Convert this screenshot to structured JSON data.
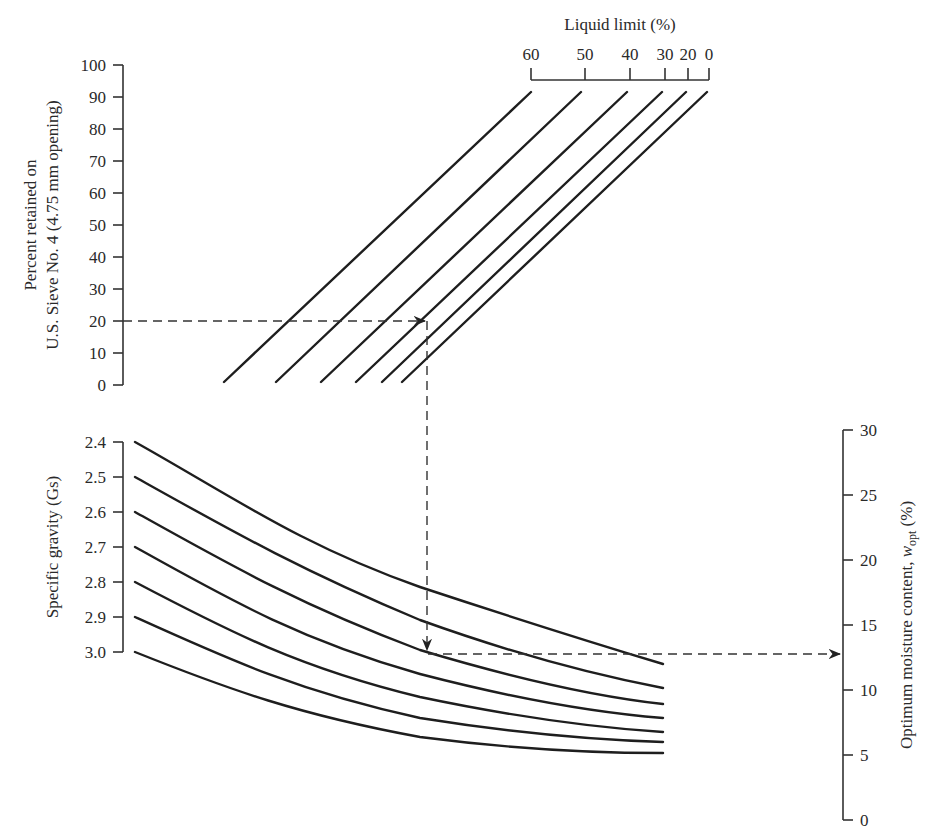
{
  "chart_data": {
    "type": "line",
    "panels": [
      {
        "name": "upper",
        "ylabel_line1": "Percent retained on",
        "ylabel_line2": "U.S. Sieve No. 4 (4.75 mm opening)",
        "yticks": [
          "0",
          "10",
          "20",
          "30",
          "40",
          "50",
          "60",
          "70",
          "80",
          "90",
          "100"
        ],
        "ylim": [
          0,
          100
        ],
        "top_axis_label": "Liquid limit (%)",
        "top_axis_ticks": [
          "60",
          "50",
          "40",
          "30",
          "20",
          "0"
        ],
        "series": [
          {
            "name": "LL 60",
            "start": {
              "percent_retained": 0
            },
            "end": {
              "percent_retained": 92
            }
          },
          {
            "name": "LL 50",
            "start": {
              "percent_retained": 0
            },
            "end": {
              "percent_retained": 92
            }
          },
          {
            "name": "LL 40",
            "start": {
              "percent_retained": 0
            },
            "end": {
              "percent_retained": 92
            }
          },
          {
            "name": "LL 30",
            "start": {
              "percent_retained": 0
            },
            "end": {
              "percent_retained": 92
            }
          },
          {
            "name": "LL 20",
            "start": {
              "percent_retained": 0
            },
            "end": {
              "percent_retained": 92
            }
          },
          {
            "name": "LL 0",
            "start": {
              "percent_retained": 0
            },
            "end": {
              "percent_retained": 92
            }
          }
        ]
      },
      {
        "name": "lower",
        "ylabel": "Specific gravity (Gs)",
        "yticks_left": [
          "2.4",
          "2.5",
          "2.6",
          "2.7",
          "2.8",
          "2.9",
          "3.0"
        ],
        "right_axis_label": "Optimum moisture content, w_opt (%)",
        "right_axis_label_main": "Optimum moisture content, ",
        "right_axis_label_sym": "w",
        "right_axis_label_sub": "opt",
        "right_axis_label_end": " (%)",
        "yticks_right": [
          "0",
          "5",
          "10",
          "15",
          "20",
          "25",
          "30"
        ],
        "ylim_right": [
          0,
          30
        ],
        "series": [
          {
            "name": "Gs 2.4",
            "w_opt_start": 30.7,
            "w_opt_end": 12.5
          },
          {
            "name": "Gs 2.5",
            "w_opt_start": 28.0,
            "w_opt_end": 10.3
          },
          {
            "name": "Gs 2.6",
            "w_opt_start": 25.3,
            "w_opt_end": 9.0
          },
          {
            "name": "Gs 2.7",
            "w_opt_start": 22.6,
            "w_opt_end": 7.9
          },
          {
            "name": "Gs 2.8",
            "w_opt_start": 19.9,
            "w_opt_end": 6.8
          },
          {
            "name": "Gs 2.9",
            "w_opt_start": 17.2,
            "w_opt_end": 6.0
          },
          {
            "name": "Gs 3.0",
            "w_opt_start": 14.5,
            "w_opt_end": 5.2
          }
        ]
      }
    ],
    "example_path": {
      "percent_retained": 20,
      "result_w_opt": 12,
      "description": "Dashed arrow from 20% retained across to liquid-limit line, down to Gs curve, then across to w_opt ≈ 12%"
    }
  }
}
